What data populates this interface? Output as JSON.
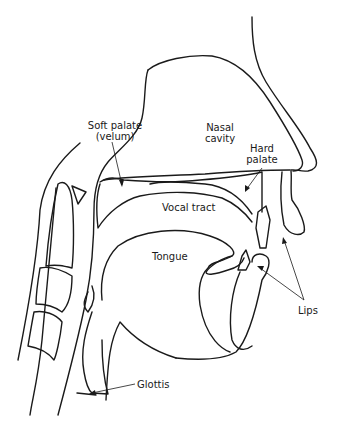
{
  "figure": {
    "type": "anatomical-diagram",
    "line_color": "#1a1a1a",
    "background": "#ffffff"
  },
  "labels": {
    "soft_palate": {
      "line1": "Soft palate",
      "line2": "(velum)"
    },
    "nasal_cavity": {
      "line1": "Nasal",
      "line2": "cavity"
    },
    "hard_palate": {
      "line1": "Hard",
      "line2": "palate"
    },
    "vocal_tract": "Vocal tract",
    "tongue": "Tongue",
    "lips": "Lips",
    "glottis": "Glottis"
  }
}
